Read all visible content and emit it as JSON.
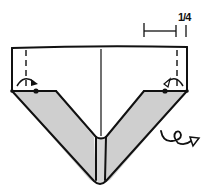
{
  "diagram": {
    "type": "origami-step",
    "measure_label": "1/4",
    "colors": {
      "line": "#111111",
      "shade": "#cfcfcf",
      "paper": "#ffffff"
    },
    "elements": [
      {
        "name": "paper-outline",
        "kind": "shape"
      },
      {
        "name": "center-crease",
        "kind": "line"
      },
      {
        "name": "left-valley-fold-dashed",
        "kind": "dashed-line"
      },
      {
        "name": "right-valley-fold-dashed",
        "kind": "dashed-line"
      },
      {
        "name": "left-fold-arrow",
        "kind": "arrow"
      },
      {
        "name": "right-fold-arrow",
        "kind": "arrow"
      },
      {
        "name": "left-reference-dot",
        "kind": "point"
      },
      {
        "name": "right-reference-dot",
        "kind": "point"
      },
      {
        "name": "shaded-flaps",
        "kind": "fill"
      },
      {
        "name": "turn-over-arrow",
        "kind": "symbol"
      },
      {
        "name": "measurement-bracket",
        "kind": "dimension"
      }
    ]
  }
}
